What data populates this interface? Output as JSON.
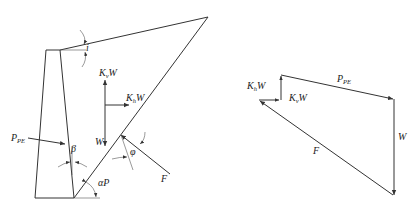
{
  "figure": {
    "left_panel": {
      "title": "Retaining wall with active wedge (Mononobe-Okabe)",
      "labels": {
        "khw": "K",
        "khw_sub": "h",
        "khw_tail": "W",
        "kvw": "K",
        "kvw_sub": "v",
        "kvw_tail": "W",
        "w": "W",
        "ppe": "P",
        "ppe_sub": "PE",
        "beta": "β",
        "i": "i",
        "phi": "φ",
        "f": "F",
        "alpha": "αP"
      }
    },
    "right_panel": {
      "title": "Force polygon",
      "labels": {
        "khw": "K",
        "khw_sub": "h",
        "khw_tail": "W",
        "kvw": "K",
        "kvw_sub": "v",
        "kvw_tail": "W",
        "ppe": "P",
        "ppe_sub": "PE",
        "w": "W",
        "f": "F"
      }
    }
  }
}
